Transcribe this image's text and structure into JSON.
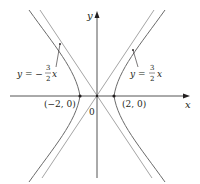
{
  "figure": {
    "equation": "x^2/4 - y^2/9 = 1",
    "axes": {
      "x_label": "x",
      "y_label": "y",
      "origin_label": "0"
    },
    "vertices": [
      {
        "label": "(−2, 0)",
        "x": -2,
        "y": 0
      },
      {
        "label": "(2, 0)",
        "x": 2,
        "y": 0
      }
    ],
    "asymptotes": [
      {
        "label_prefix": "y = −",
        "num": "3",
        "den": "2",
        "var": "x",
        "slope": -1.5
      },
      {
        "label_prefix": "y = ",
        "num": "3",
        "den": "2",
        "var": "x",
        "slope": 1.5
      }
    ],
    "colors": {
      "axis": "#231f20",
      "curve": "#5a5a5a",
      "asymptote": "#8a8a8a",
      "text": "#231f20"
    }
  }
}
